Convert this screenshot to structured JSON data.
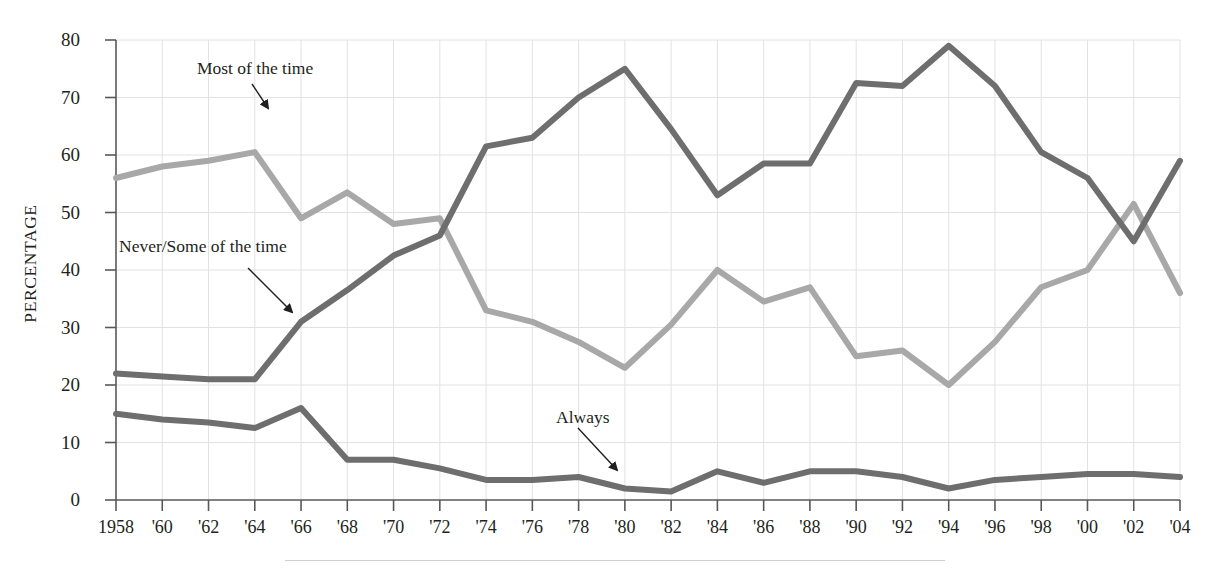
{
  "figure": {
    "top_caption": "",
    "footer_rule_visible": true
  },
  "axes": {
    "y_title": "PERCENTAGE",
    "y_ticks": [
      0,
      10,
      20,
      30,
      40,
      50,
      60,
      70,
      80
    ],
    "x_ticks": [
      "1958",
      "'60",
      "'62",
      "'64",
      "'66",
      "'68",
      "'70",
      "'72",
      "'74",
      "'76",
      "'78",
      "'80",
      "'82",
      "'84",
      "'86",
      "'88",
      "'90",
      "'92",
      "'94",
      "'96",
      "'98",
      "'00",
      "'02",
      "'04"
    ]
  },
  "annotations": [
    {
      "id": "most",
      "text": "Most of the time"
    },
    {
      "id": "never",
      "text": "Never/Some of the time"
    },
    {
      "id": "always",
      "text": "Always"
    }
  ],
  "colors": {
    "most_of_the_time": "#a8a8a8",
    "never_some_of_the_time": "#6e6e6e",
    "always": "#6e6e6e",
    "gridline": "#e2e2e4",
    "axis": "#58585a",
    "text": "#231f20",
    "footer_rule": "#cfcfcf"
  },
  "chart_data": {
    "type": "line",
    "title": "",
    "subtitle": "",
    "xlabel": "",
    "ylabel": "PERCENTAGE",
    "ylim": [
      0,
      80
    ],
    "xlim": [
      1958,
      2004
    ],
    "grid": true,
    "legend": "inline-annotations",
    "x": [
      1958,
      1960,
      1962,
      1964,
      1966,
      1968,
      1970,
      1972,
      1974,
      1976,
      1978,
      1980,
      1982,
      1984,
      1986,
      1988,
      1990,
      1992,
      1994,
      1996,
      1998,
      2000,
      2002,
      2004
    ],
    "series": [
      {
        "name": "Most of the time",
        "color": "#a8a8a8",
        "values": [
          56,
          58,
          59,
          60.5,
          49,
          53.5,
          48,
          49,
          33,
          31,
          27.5,
          23,
          30.5,
          40,
          34.5,
          37,
          25,
          26,
          20,
          27.5,
          37,
          40,
          51.5,
          36
        ]
      },
      {
        "name": "Never/Some of the time",
        "color": "#6e6e6e",
        "values": [
          22,
          21.5,
          21,
          21,
          31,
          36.5,
          42.5,
          46,
          61.5,
          63,
          70,
          75,
          64.5,
          53,
          58.5,
          58.5,
          72.5,
          72,
          79,
          72,
          60.5,
          56,
          45,
          59
        ]
      },
      {
        "name": "Always",
        "color": "#6e6e6e",
        "values": [
          15,
          14,
          13.5,
          12.5,
          16,
          7,
          7,
          5.5,
          3.5,
          3.5,
          4,
          2,
          1.5,
          5,
          3,
          5,
          5,
          4,
          2,
          3.5,
          4,
          4.5,
          4.5,
          4
        ]
      }
    ]
  }
}
